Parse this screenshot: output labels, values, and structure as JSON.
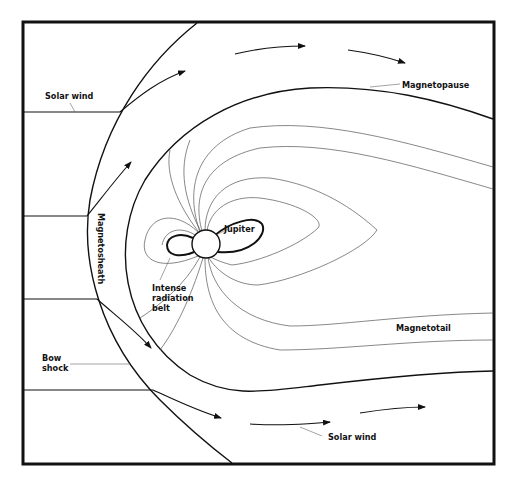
{
  "diagram": {
    "labels": {
      "solar_wind_top": "Solar wind",
      "magnetopause": "Magnetopause",
      "magnetosheath": "Magnetosheath",
      "jupiter": "Jupiter",
      "radiation_belt_line1": "Intense",
      "radiation_belt_line2": "radiation",
      "radiation_belt_line3": "belt",
      "magnetotail": "Magnetotail",
      "bow_shock_line1": "Bow",
      "bow_shock_line2": "shock",
      "solar_wind_bottom": "Solar wind"
    },
    "colors": {
      "ink": "#111111",
      "field_line": "#555555",
      "background": "#ffffff"
    }
  }
}
